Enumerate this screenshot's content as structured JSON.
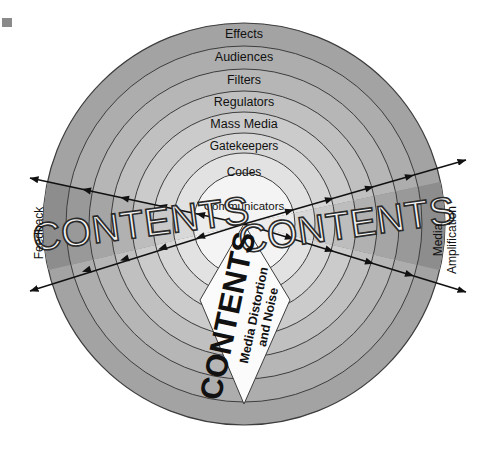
{
  "diagram": {
    "rings": [
      {
        "label": "Effects",
        "outer_r": 201,
        "fill": "#a3a3a3"
      },
      {
        "label": "Audiences",
        "outer_r": 178,
        "fill": "#adadad"
      },
      {
        "label": "Filters",
        "outer_r": 155,
        "fill": "#b6b6b6"
      },
      {
        "label": "Regulators",
        "outer_r": 133,
        "fill": "#c0c0c0"
      },
      {
        "label": "Mass Media",
        "outer_r": 112,
        "fill": "#cbcbcb"
      },
      {
        "label": "Gatekeepers",
        "outer_r": 91,
        "fill": "#d6d6d6"
      },
      {
        "label": "Codes",
        "outer_r": 71,
        "fill": "#e2e2e2"
      },
      {
        "label": "Communicators",
        "outer_r": 51,
        "fill": "#f4f4f4"
      }
    ],
    "cone_left_label": "CONTENTS",
    "cone_right_label": "CONTENTS",
    "bottom_label": "CONTENTS",
    "bottom_sublabel_line1": "Media Distortion",
    "bottom_sublabel_line2": "and Noise",
    "left_axis_label": "Feedback",
    "right_axis_label_line1": "Media",
    "right_axis_label_line2": "Amplification",
    "colors": {
      "outer_ring": "#a3a3a3",
      "cone_dark": "#8d8d8d",
      "cone_light": "#cfcfcf",
      "stroke": "#3a3a3a",
      "text": "#111111",
      "background": "#ffffff",
      "bottom_wedge": "#fbfbfb"
    }
  }
}
